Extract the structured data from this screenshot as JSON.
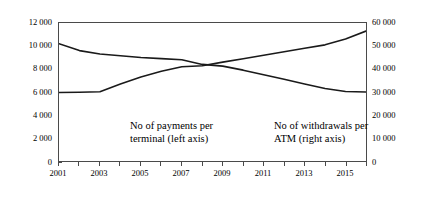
{
  "chart_data": {
    "type": "line",
    "title": "",
    "subtitle": "",
    "xlabel": "",
    "ylabel": "",
    "grid": false,
    "legend_position": "inline-annotation",
    "x": [
      2001,
      2002,
      2003,
      2004,
      2005,
      2006,
      2007,
      2008,
      2009,
      2010,
      2011,
      2012,
      2013,
      2014,
      2015,
      2016
    ],
    "x_tick_labels": [
      "2001",
      "",
      "2003",
      "",
      "2005",
      "",
      "2007",
      "",
      "2009",
      "",
      "2011",
      "",
      "2013",
      "",
      "2015",
      ""
    ],
    "x_tick_labels_shown": [
      "2001",
      "2003",
      "2005",
      "2007",
      "2009",
      "2011",
      "2013",
      "2015"
    ],
    "xlim": [
      2001,
      2016
    ],
    "axes": [
      {
        "id": "left",
        "side": "left",
        "ylim": [
          0,
          12000
        ],
        "ytick_values": [
          0,
          2000,
          4000,
          6000,
          8000,
          10000,
          12000
        ],
        "ytick_labels": [
          "0",
          "2 000",
          "4 000",
          "6 000",
          "8 000",
          "10 000",
          "12 000"
        ]
      },
      {
        "id": "right",
        "side": "right",
        "ylim": [
          0,
          60000
        ],
        "ytick_values": [
          0,
          10000,
          20000,
          30000,
          40000,
          50000,
          60000
        ],
        "ytick_labels": [
          "0",
          "10 000",
          "20 000",
          "30 000",
          "40 000",
          "50 000",
          "60 000"
        ]
      }
    ],
    "series": [
      {
        "name": "No of payments per terminal (left axis)",
        "axis": "left",
        "color": "#1a1a1a",
        "values": [
          10200,
          9600,
          9300,
          9150,
          9000,
          8900,
          8800,
          8400,
          8250,
          7900,
          7500,
          7100,
          6700,
          6300,
          6050,
          6000
        ]
      },
      {
        "name": "No of withdrawals per ATM (right axis)",
        "axis": "right",
        "color": "#1a1a1a",
        "values": [
          29800,
          29900,
          30100,
          33500,
          36500,
          39000,
          41000,
          41400,
          43000,
          44500,
          46000,
          47500,
          49000,
          50500,
          53000,
          56500
        ]
      }
    ],
    "annotations": [
      {
        "id": "payments",
        "line1": "No of payments per",
        "line2": "terminal (left axis)"
      },
      {
        "id": "withdrawals",
        "line1": "No of withdrawals per",
        "line2": "ATM (right axis)"
      }
    ]
  }
}
